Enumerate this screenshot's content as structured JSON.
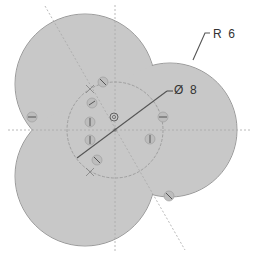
{
  "drawing": {
    "type": "cad-top-view",
    "colors": {
      "fill": "#c8c8c8",
      "outline": "#9a9a9a",
      "centerline": "#a8a8a8",
      "dimension": "#444444",
      "text": "#333333",
      "background": "#ffffff"
    },
    "dimensions": [
      {
        "id": "radius",
        "label": "R  6",
        "x": 209,
        "y": 27
      },
      {
        "id": "diameter",
        "label": "Ø  8",
        "x": 173,
        "y": 83
      }
    ],
    "lobes": [
      {
        "name": "upper-left-lobe",
        "cx": 85,
        "cy": 84,
        "r": 70
      },
      {
        "name": "right-lobe",
        "cx": 170,
        "cy": 130,
        "r": 67
      },
      {
        "name": "lower-left-lobe",
        "cx": 85,
        "cy": 176,
        "r": 70
      }
    ],
    "inner_circle": {
      "cx": 115,
      "cy": 130,
      "r": 48
    },
    "center_marker": {
      "cx": 114,
      "cy": 117,
      "r": 4
    },
    "screw_markers": [
      {
        "cx": 103,
        "cy": 82
      },
      {
        "cx": 92,
        "cy": 103
      },
      {
        "cx": 32,
        "cy": 117
      },
      {
        "cx": 163,
        "cy": 117
      },
      {
        "cx": 90,
        "cy": 122
      },
      {
        "cx": 90,
        "cy": 140
      },
      {
        "cx": 150,
        "cy": 139
      },
      {
        "cx": 97,
        "cy": 160
      },
      {
        "cx": 169,
        "cy": 196
      }
    ],
    "cross_marks": [
      {
        "x": 90,
        "y": 89
      },
      {
        "x": 90,
        "y": 172
      }
    ]
  }
}
